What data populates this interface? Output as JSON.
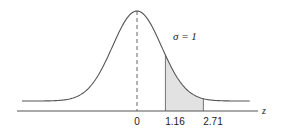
{
  "chart_data": {
    "type": "area",
    "xlabel": "z",
    "ylabel": "",
    "distribution": "standard normal",
    "mean": 0,
    "sigma": 1,
    "annotation": "σ = 1",
    "tick_labels": [
      "0",
      "1.16",
      "2.71"
    ],
    "ticks": [
      0,
      1.16,
      2.71
    ],
    "shaded_region": {
      "from": 1.16,
      "to": 2.71
    },
    "mean_line": {
      "x": 0,
      "style": "dashed"
    },
    "xlim": [
      -4.7,
      4.6
    ],
    "grid": false,
    "legend": null,
    "colors": {
      "curve": "#555555",
      "axis": "#555555",
      "shade": "#e2e2e2",
      "text": "#1a1a1a"
    }
  },
  "labels": {
    "sigma": "σ = 1",
    "z_axis": "z",
    "tick_0": "0",
    "tick_1": "1.16",
    "tick_2": "2.71"
  }
}
